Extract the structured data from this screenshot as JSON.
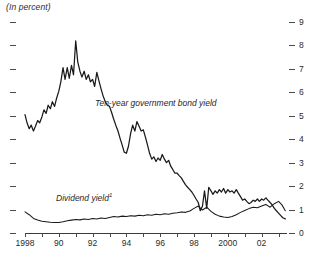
{
  "chart_data": {
    "type": "line",
    "title": "(In percent)",
    "xlabel": "",
    "ylabel": "",
    "ylim": [
      0,
      9
    ],
    "xlim": [
      1988,
      2003.5
    ],
    "grid": false,
    "legend_position": "inline-annotation",
    "y_ticks": [
      0,
      1,
      2,
      3,
      4,
      5,
      6,
      7,
      8,
      9
    ],
    "y_tick_labels": [
      "0",
      "1",
      "2",
      "3",
      "4",
      "5",
      "6",
      "7",
      "8",
      "9"
    ],
    "y_axis_side": "right",
    "x_ticks": [
      1988,
      1989,
      1990,
      1991,
      1992,
      1993,
      1994,
      1995,
      1996,
      1997,
      1998,
      1999,
      2000,
      2001,
      2002,
      2003
    ],
    "x_tick_labels_shown": [
      {
        "x": 1988,
        "label": "1998"
      },
      {
        "x": 1990,
        "label": "90"
      },
      {
        "x": 1992,
        "label": "92"
      },
      {
        "x": 1994,
        "label": "94"
      },
      {
        "x": 1996,
        "label": "96"
      },
      {
        "x": 1998,
        "label": "98"
      },
      {
        "x": 2000,
        "label": "2000"
      },
      {
        "x": 2002,
        "label": "02"
      }
    ],
    "annotations": [
      {
        "text": "Ten-year government bond yield",
        "x": 1994.3,
        "y": 5.7
      },
      {
        "text": "Dividend yield",
        "footnote": "1",
        "x": 1990.0,
        "y": 1.8
      }
    ],
    "series": [
      {
        "name": "Ten-year government bond yield",
        "color": "#1a1a1a",
        "x": [
          1988.0,
          1988.12,
          1988.25,
          1988.37,
          1988.5,
          1988.62,
          1988.75,
          1988.87,
          1989.0,
          1989.12,
          1989.25,
          1989.37,
          1989.5,
          1989.62,
          1989.75,
          1989.87,
          1990.0,
          1990.12,
          1990.25,
          1990.37,
          1990.5,
          1990.62,
          1990.75,
          1990.87,
          1991.0,
          1991.12,
          1991.25,
          1991.37,
          1991.5,
          1991.62,
          1991.75,
          1991.87,
          1992.0,
          1992.12,
          1992.25,
          1992.37,
          1992.5,
          1992.62,
          1992.75,
          1992.87,
          1993.0,
          1993.12,
          1993.25,
          1993.37,
          1993.5,
          1993.62,
          1993.75,
          1993.87,
          1994.0,
          1994.12,
          1994.25,
          1994.37,
          1994.5,
          1994.62,
          1994.75,
          1994.87,
          1995.0,
          1995.12,
          1995.25,
          1995.37,
          1995.5,
          1995.62,
          1995.75,
          1995.87,
          1996.0,
          1996.12,
          1996.25,
          1996.37,
          1996.5,
          1996.62,
          1996.75,
          1996.87,
          1997.0,
          1997.12,
          1997.25,
          1997.37,
          1997.5,
          1997.62,
          1997.75,
          1997.87,
          1998.0,
          1998.12,
          1998.25,
          1998.37,
          1998.5,
          1998.62,
          1998.75,
          1998.87,
          1999.0,
          1999.12,
          1999.25,
          1999.37,
          1999.5,
          1999.62,
          1999.75,
          1999.87,
          2000.0,
          2000.12,
          2000.25,
          2000.37,
          2000.5,
          2000.62,
          2000.75,
          2000.87,
          2001.0,
          2001.12,
          2001.25,
          2001.37,
          2001.5,
          2001.62,
          2001.75,
          2001.87,
          2002.0,
          2002.12,
          2002.25,
          2002.37,
          2002.5,
          2002.62,
          2002.75,
          2002.87,
          2003.0,
          2003.12,
          2003.25,
          2003.4
        ],
        "y": [
          5.05,
          4.7,
          4.45,
          4.6,
          4.35,
          4.55,
          4.8,
          4.7,
          4.95,
          5.25,
          5.1,
          5.45,
          5.3,
          5.6,
          5.4,
          5.75,
          6.05,
          6.45,
          7.05,
          6.55,
          7.05,
          6.6,
          7.15,
          6.75,
          8.2,
          7.3,
          6.9,
          6.65,
          6.9,
          6.55,
          6.75,
          6.45,
          6.55,
          6.25,
          6.85,
          6.5,
          6.15,
          5.85,
          5.6,
          5.45,
          5.4,
          5.15,
          4.85,
          4.6,
          4.35,
          4.05,
          3.75,
          3.45,
          3.4,
          3.7,
          4.25,
          4.6,
          4.35,
          4.75,
          4.55,
          4.35,
          4.4,
          4.1,
          3.75,
          3.4,
          3.15,
          3.25,
          3.05,
          3.2,
          3.1,
          3.35,
          3.15,
          3.0,
          3.1,
          2.85,
          2.7,
          2.55,
          2.55,
          2.45,
          2.35,
          2.2,
          2.05,
          1.95,
          1.85,
          1.75,
          1.6,
          1.45,
          1.3,
          0.95,
          1.15,
          1.8,
          1.05,
          1.95,
          1.8,
          1.65,
          1.8,
          1.7,
          1.85,
          1.75,
          1.9,
          1.7,
          1.85,
          1.75,
          1.8,
          1.7,
          1.85,
          1.7,
          1.55,
          1.4,
          1.45,
          1.35,
          1.25,
          1.3,
          1.4,
          1.35,
          1.45,
          1.35,
          1.45,
          1.4,
          1.5,
          1.4,
          1.3,
          1.2,
          1.05,
          0.95,
          0.85,
          0.75,
          0.65,
          0.6
        ]
      },
      {
        "name": "Dividend yield",
        "color": "#1a1a1a",
        "x": [
          1988.0,
          1988.25,
          1988.5,
          1988.75,
          1989.0,
          1989.25,
          1989.5,
          1989.75,
          1990.0,
          1990.25,
          1990.5,
          1990.75,
          1991.0,
          1991.25,
          1991.5,
          1991.75,
          1992.0,
          1992.25,
          1992.5,
          1992.75,
          1993.0,
          1993.25,
          1993.5,
          1993.75,
          1994.0,
          1994.25,
          1994.5,
          1994.75,
          1995.0,
          1995.25,
          1995.5,
          1995.75,
          1996.0,
          1996.25,
          1996.5,
          1996.75,
          1997.0,
          1997.25,
          1997.5,
          1997.75,
          1998.0,
          1998.25,
          1998.5,
          1998.75,
          1999.0,
          1999.25,
          1999.5,
          1999.75,
          2000.0,
          2000.25,
          2000.5,
          2000.75,
          2001.0,
          2001.25,
          2001.5,
          2001.75,
          2002.0,
          2002.25,
          2002.5,
          2002.75,
          2003.0,
          2003.2,
          2003.4
        ],
        "y": [
          0.9,
          0.78,
          0.62,
          0.55,
          0.5,
          0.48,
          0.46,
          0.45,
          0.45,
          0.48,
          0.52,
          0.55,
          0.58,
          0.56,
          0.6,
          0.58,
          0.62,
          0.6,
          0.64,
          0.62,
          0.66,
          0.7,
          0.68,
          0.72,
          0.7,
          0.74,
          0.72,
          0.76,
          0.74,
          0.78,
          0.76,
          0.8,
          0.78,
          0.82,
          0.8,
          0.84,
          0.86,
          0.9,
          0.88,
          0.94,
          1.05,
          1.15,
          0.98,
          1.1,
          0.92,
          0.8,
          0.72,
          0.68,
          0.66,
          0.7,
          0.78,
          0.88,
          0.96,
          1.04,
          1.1,
          1.08,
          1.15,
          1.22,
          1.1,
          1.25,
          1.35,
          1.2,
          0.95
        ]
      }
    ]
  }
}
